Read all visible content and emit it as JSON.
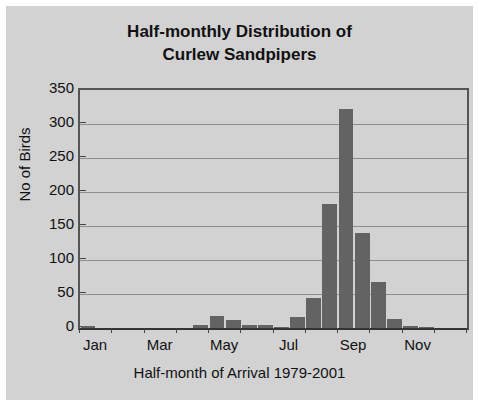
{
  "chart_data": {
    "type": "bar",
    "title": "Half-monthly Distribution of Curlew Sandpipers",
    "title_line1": "Half-monthly Distribution of",
    "title_line2": "Curlew Sandpipers",
    "xlabel": "Half-month of Arrival 1979-2001",
    "ylabel": "No of Birds",
    "ylim": [
      0,
      350
    ],
    "ytick_labels": [
      "350",
      "300",
      "250",
      "200",
      "150",
      "100",
      "50",
      "0"
    ],
    "ytick_values": [
      350,
      300,
      250,
      200,
      150,
      100,
      50,
      0
    ],
    "xtick_labels": [
      "Jan",
      "Mar",
      "May",
      "Jul",
      "Sep",
      "Nov"
    ],
    "grid": true,
    "legend": false,
    "bar_color": "#636363",
    "plot_background": "#d2d2d2",
    "categories": [
      "Jan 1",
      "Jan 2",
      "Feb 1",
      "Feb 2",
      "Mar 1",
      "Mar 2",
      "Apr 1",
      "Apr 2",
      "May 1",
      "May 2",
      "Jun 1",
      "Jun 2",
      "Jul 1",
      "Jul 2",
      "Aug 1",
      "Aug 2",
      "Sep 1",
      "Sep 2",
      "Oct 1",
      "Oct 2",
      "Nov 1",
      "Nov 2",
      "Dec 1",
      "Dec 2"
    ],
    "values": [
      3,
      0,
      0,
      0,
      0,
      0,
      0,
      4,
      18,
      12,
      4,
      4,
      2,
      16,
      44,
      183,
      322,
      139,
      68,
      13,
      3,
      2,
      0,
      0
    ]
  }
}
